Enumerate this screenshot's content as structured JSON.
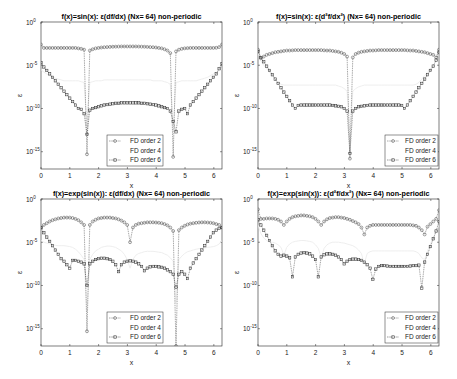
{
  "chart_data": [
    {
      "type": "line",
      "title": "f(x)=sin(x): ε(df/dx) (Nx= 64) non-periodic",
      "xlabel": "x",
      "ylabel": "ε",
      "yscale": "log",
      "xlim": [
        0,
        6.2832
      ],
      "ylim": [
        1e-17,
        1
      ],
      "xticks": [
        0,
        1,
        2,
        3,
        4,
        5,
        6
      ],
      "yticks": [
        "10^0",
        "10^-5",
        "10^-10",
        "10^-15"
      ],
      "legend": {
        "position": "lower center",
        "entries": [
          "FD order 2",
          "FD order 4",
          "FD order 6"
        ]
      },
      "series": [
        {
          "name": "FD order 2",
          "marker": "circle",
          "color": "#555555",
          "log10": [
            -2.6,
            -3.0,
            -3.0,
            -3.0,
            -3.0,
            -3.0,
            -3.0,
            -3.0,
            -3.0,
            -3.0,
            -3.0,
            -3.0,
            -3.0,
            -3.05,
            -3.1,
            -3.2,
            -15.3,
            -3.3,
            -3.15,
            -3.05,
            -3.0,
            -2.95,
            -2.92,
            -2.9,
            -2.88,
            -2.86,
            -2.85,
            -2.84,
            -2.83,
            -2.83,
            -2.83,
            -2.83,
            -2.83,
            -2.83,
            -2.84,
            -2.85,
            -2.86,
            -2.88,
            -2.9,
            -2.92,
            -2.95,
            -3.0,
            -3.05,
            -3.15,
            -3.3,
            -3.6,
            -15.6,
            -3.4,
            -3.2,
            -3.1,
            -3.05,
            -3.02,
            -3.0,
            -3.0,
            -3.0,
            -3.0,
            -3.0,
            -3.0,
            -3.0,
            -3.0,
            -3.0,
            -2.98,
            -2.9,
            -2.6
          ]
        },
        {
          "name": "FD order 4",
          "marker": "none",
          "color": "#f2f2f2",
          "log10": [
            -5.5,
            -5.8,
            -6.0,
            -6.2,
            -6.4,
            -6.5,
            -6.6,
            -6.7,
            -6.8,
            -6.8,
            -6.8,
            -6.8,
            -6.8,
            -6.8,
            -6.9,
            -7.0,
            -12.0,
            -7.0,
            -6.9,
            -6.8,
            -6.8,
            -6.8,
            -6.7,
            -6.7,
            -6.7,
            -6.7,
            -6.7,
            -6.7,
            -6.7,
            -6.7,
            -6.7,
            -6.7,
            -6.7,
            -6.7,
            -6.7,
            -6.7,
            -6.7,
            -6.7,
            -6.7,
            -6.8,
            -6.8,
            -6.8,
            -6.8,
            -6.9,
            -7.0,
            -7.2,
            -12.5,
            -7.0,
            -6.9,
            -6.8,
            -6.8,
            -6.8,
            -6.8,
            -6.8,
            -6.8,
            -6.7,
            -6.6,
            -6.5,
            -6.4,
            -6.2,
            -6.0,
            -5.8,
            -5.6,
            -5.4
          ]
        },
        {
          "name": "FD order 6",
          "marker": "square",
          "color": "#333333",
          "log10": [
            -4.7,
            -5.2,
            -5.6,
            -6.0,
            -6.4,
            -6.8,
            -7.2,
            -7.6,
            -8.0,
            -8.4,
            -8.8,
            -9.2,
            -9.6,
            -10.0,
            -10.1,
            -10.6,
            -13.0,
            -10.2,
            -10.0,
            -9.9,
            -9.8,
            -9.7,
            -9.6,
            -9.55,
            -9.5,
            -9.45,
            -9.4,
            -9.4,
            -9.35,
            -9.35,
            -9.35,
            -9.35,
            -9.35,
            -9.35,
            -9.35,
            -9.4,
            -9.4,
            -9.45,
            -9.5,
            -9.55,
            -9.6,
            -9.7,
            -9.8,
            -9.9,
            -10.0,
            -10.3,
            -11.5,
            -12.7,
            -10.3,
            -10.1,
            -10.0,
            -10.6,
            -9.6,
            -9.2,
            -8.8,
            -8.4,
            -8.0,
            -7.6,
            -7.2,
            -6.8,
            -6.4,
            -6.0,
            -5.4,
            -4.8
          ]
        }
      ]
    },
    {
      "type": "line",
      "title": "f(x)=sin(x): ε(d²f/dx²) (Nx= 64) non-periodic",
      "xlabel": "x",
      "ylabel": "ε",
      "yscale": "log",
      "xlim": [
        0,
        6.2832
      ],
      "ylim": [
        1e-17,
        1
      ],
      "xticks": [
        0,
        1,
        2,
        3,
        4,
        5,
        6
      ],
      "yticks": [
        "10^0",
        "10^-5",
        "10^-10",
        "10^-15"
      ],
      "legend": {
        "position": "lower right",
        "entries": [
          "FD order 2",
          "FD order 4",
          "FD order 6"
        ]
      },
      "series": [
        {
          "name": "FD order 2",
          "marker": "circle",
          "color": "#555555",
          "log10": [
            -3.2,
            -4.2,
            -4.0,
            -3.8,
            -3.7,
            -3.6,
            -3.5,
            -3.45,
            -3.4,
            -3.35,
            -3.3,
            -3.3,
            -3.28,
            -3.25,
            -3.25,
            -3.25,
            -3.25,
            -3.25,
            -3.25,
            -3.25,
            -3.25,
            -3.25,
            -3.25,
            -3.28,
            -3.3,
            -3.3,
            -3.35,
            -3.4,
            -3.45,
            -3.55,
            -3.7,
            -4.0,
            -15.8,
            -4.1,
            -3.7,
            -3.55,
            -3.45,
            -3.4,
            -3.35,
            -3.3,
            -3.3,
            -3.28,
            -3.25,
            -3.25,
            -3.25,
            -3.25,
            -3.25,
            -3.25,
            -3.25,
            -3.25,
            -3.25,
            -3.25,
            -3.28,
            -3.3,
            -3.3,
            -3.35,
            -3.4,
            -3.45,
            -3.5,
            -3.6,
            -3.7,
            -3.8,
            -4.1,
            -3.2
          ]
        },
        {
          "name": "FD order 4",
          "marker": "none",
          "color": "#f2f2f2",
          "log10": [
            -3.6,
            -4.5,
            -5.0,
            -5.4,
            -5.8,
            -6.2,
            -6.6,
            -7.0,
            -7.2,
            -7.3,
            -7.3,
            -7.3,
            -7.3,
            -7.3,
            -7.3,
            -7.3,
            -7.3,
            -7.3,
            -7.3,
            -7.3,
            -7.3,
            -7.3,
            -7.3,
            -7.3,
            -7.3,
            -7.3,
            -7.3,
            -7.3,
            -7.4,
            -7.5,
            -7.7,
            -8.0,
            -14.0,
            -8.0,
            -7.7,
            -7.5,
            -7.4,
            -7.3,
            -7.3,
            -7.3,
            -7.3,
            -7.3,
            -7.3,
            -7.3,
            -7.3,
            -7.3,
            -7.3,
            -7.3,
            -7.3,
            -7.3,
            -7.3,
            -7.3,
            -7.3,
            -7.3,
            -7.3,
            -7.2,
            -7.0,
            -6.6,
            -6.2,
            -5.8,
            -5.4,
            -5.0,
            -4.5,
            -3.6
          ]
        },
        {
          "name": "FD order 6",
          "marker": "square",
          "color": "#333333",
          "log10": [
            -3.4,
            -4.1,
            -4.6,
            -5.1,
            -5.6,
            -6.1,
            -6.6,
            -7.1,
            -7.6,
            -8.1,
            -8.6,
            -9.1,
            -9.6,
            -10.0,
            -9.65,
            -9.6,
            -9.6,
            -9.6,
            -9.6,
            -9.6,
            -9.6,
            -9.6,
            -9.6,
            -9.6,
            -9.6,
            -9.6,
            -9.65,
            -9.7,
            -9.75,
            -9.8,
            -10.0,
            -10.3,
            -15.2,
            -10.3,
            -10.0,
            -9.8,
            -9.75,
            -9.7,
            -9.65,
            -9.6,
            -9.6,
            -9.6,
            -9.6,
            -9.6,
            -9.6,
            -9.6,
            -9.6,
            -9.6,
            -9.6,
            -9.6,
            -9.65,
            -10.0,
            -9.6,
            -9.1,
            -8.6,
            -8.1,
            -7.6,
            -7.1,
            -6.6,
            -6.1,
            -5.6,
            -5.1,
            -4.4,
            -3.5
          ]
        }
      ]
    },
    {
      "type": "line",
      "title": "f(x)=exp(sin(x)): ε(df/dx) (Nx= 64) non-periodic",
      "xlabel": "x",
      "ylabel": "ε",
      "yscale": "log",
      "xlim": [
        0,
        6.2832
      ],
      "ylim": [
        1e-17,
        1
      ],
      "xticks": [
        0,
        1,
        2,
        3,
        4,
        5,
        6
      ],
      "yticks": [
        "10^0",
        "10^-5",
        "10^-10",
        "10^-15"
      ],
      "legend": {
        "position": "lower center",
        "entries": [
          "FD order 2",
          "FD order 4",
          "FD order 6"
        ]
      },
      "series": [
        {
          "name": "FD order 2",
          "marker": "circle",
          "color": "#555555",
          "log10": [
            -3.3,
            -3.0,
            -2.8,
            -2.6,
            -2.45,
            -2.35,
            -2.25,
            -2.2,
            -2.15,
            -2.15,
            -2.15,
            -2.2,
            -2.3,
            -2.45,
            -2.7,
            -3.0,
            -15.3,
            -3.0,
            -2.6,
            -2.4,
            -2.25,
            -2.2,
            -2.15,
            -2.15,
            -2.15,
            -2.2,
            -2.25,
            -2.35,
            -2.5,
            -2.7,
            -3.0,
            -5.0,
            -3.3,
            -3.0,
            -2.85,
            -2.8,
            -2.75,
            -2.7,
            -2.7,
            -2.7,
            -2.72,
            -2.75,
            -2.8,
            -2.9,
            -3.05,
            -3.3,
            -3.7,
            -17.0,
            -3.6,
            -3.3,
            -3.1,
            -2.95,
            -2.85,
            -2.8,
            -2.75,
            -2.72,
            -2.7,
            -2.7,
            -2.72,
            -2.75,
            -2.8,
            -2.9,
            -3.0,
            -3.3
          ]
        },
        {
          "name": "FD order 4",
          "marker": "none",
          "color": "#f2f2f2",
          "log10": [
            -4.8,
            -5.0,
            -5.1,
            -5.2,
            -5.3,
            -5.35,
            -5.4,
            -5.4,
            -5.4,
            -5.45,
            -5.5,
            -5.6,
            -5.8,
            -6.1,
            -6.5,
            -7.0,
            -13.0,
            -7.0,
            -6.4,
            -6.0,
            -5.8,
            -5.6,
            -5.5,
            -5.45,
            -5.45,
            -5.5,
            -5.6,
            -5.8,
            -6.0,
            -6.4,
            -7.0,
            -8.0,
            -7.0,
            -6.5,
            -6.3,
            -6.2,
            -6.1,
            -6.05,
            -6.05,
            -6.05,
            -6.1,
            -6.15,
            -6.2,
            -6.35,
            -6.5,
            -6.8,
            -7.2,
            -12.0,
            -7.0,
            -6.6,
            -6.3,
            -6.1,
            -6.0,
            -5.9,
            -5.8,
            -5.75,
            -5.7,
            -5.65,
            -5.6,
            -5.55,
            -5.5,
            -5.4,
            -5.2,
            -4.8
          ]
        },
        {
          "name": "FD order 6",
          "marker": "square",
          "color": "#333333",
          "log10": [
            -3.3,
            -3.9,
            -4.4,
            -4.9,
            -5.4,
            -5.9,
            -6.4,
            -6.9,
            -7.2,
            -7.6,
            -8.0,
            -7.1,
            -7.1,
            -7.2,
            -7.3,
            -7.5,
            -10.0,
            -7.5,
            -7.2,
            -7.0,
            -6.9,
            -6.85,
            -6.85,
            -6.9,
            -7.0,
            -7.2,
            -7.6,
            -8.4,
            -7.6,
            -7.3,
            -7.2,
            -7.15,
            -7.2,
            -7.3,
            -7.5,
            -7.8,
            -8.3,
            -8.0,
            -7.85,
            -7.8,
            -7.8,
            -7.85,
            -7.9,
            -8.0,
            -8.2,
            -8.4,
            -8.7,
            -10.2,
            -8.7,
            -8.4,
            -8.7,
            -9.2,
            -8.0,
            -7.4,
            -6.9,
            -6.4,
            -5.9,
            -5.4,
            -4.9,
            -4.4,
            -3.9,
            -3.6,
            -3.4,
            -3.3
          ]
        }
      ]
    },
    {
      "type": "line",
      "title": "f(x)=exp(sin(x)): ε(d²f/dx²) (Nx= 64) non-periodic",
      "xlabel": "x",
      "ylabel": "ε",
      "yscale": "log",
      "xlim": [
        0,
        6.2832
      ],
      "ylim": [
        1e-17,
        1
      ],
      "xticks": [
        0,
        1,
        2,
        3,
        4,
        5,
        6
      ],
      "yticks": [
        "10^0",
        "10^-5",
        "10^-10",
        "10^-15"
      ],
      "legend": {
        "position": "lower right",
        "entries": [
          "FD order 2",
          "FD order 4",
          "FD order 6"
        ]
      },
      "series": [
        {
          "name": "FD order 2",
          "marker": "circle",
          "color": "#555555",
          "log10": [
            -1.2,
            -2.3,
            -2.3,
            -2.25,
            -2.25,
            -2.25,
            -2.3,
            -2.4,
            -2.6,
            -3.0,
            -2.6,
            -2.3,
            -2.1,
            -2.0,
            -1.95,
            -1.9,
            -1.9,
            -1.95,
            -2.0,
            -2.1,
            -2.3,
            -2.6,
            -3.0,
            -2.6,
            -2.35,
            -2.2,
            -2.15,
            -2.1,
            -2.1,
            -2.15,
            -2.2,
            -2.3,
            -2.4,
            -2.55,
            -2.7,
            -2.9,
            -3.3,
            -4.1,
            -3.3,
            -3.1,
            -3.0,
            -3.0,
            -3.0,
            -3.0,
            -3.0,
            -3.0,
            -3.0,
            -3.0,
            -3.0,
            -3.0,
            -3.0,
            -3.0,
            -3.0,
            -3.0,
            -3.05,
            -3.1,
            -3.3,
            -3.6,
            -4.1,
            -3.2,
            -2.9,
            -2.6,
            -2.3,
            -1.3
          ]
        },
        {
          "name": "FD order 4",
          "marker": "none",
          "color": "#f2f2f2",
          "log10": [
            -3.0,
            -4.0,
            -4.5,
            -4.8,
            -5.0,
            -5.0,
            -5.1,
            -5.3,
            -5.6,
            -6.5,
            -5.6,
            -5.2,
            -5.0,
            -4.9,
            -4.85,
            -4.8,
            -4.8,
            -4.85,
            -4.9,
            -5.0,
            -5.3,
            -5.7,
            -6.8,
            -5.7,
            -5.3,
            -5.1,
            -5.0,
            -5.0,
            -5.0,
            -5.05,
            -5.1,
            -5.2,
            -5.3,
            -5.4,
            -5.6,
            -5.9,
            -6.3,
            -7.5,
            -6.3,
            -6.1,
            -6.0,
            -6.0,
            -6.0,
            -6.0,
            -6.0,
            -6.0,
            -6.0,
            -6.0,
            -6.0,
            -6.0,
            -6.0,
            -6.0,
            -6.0,
            -6.0,
            -6.0,
            -6.1,
            -6.3,
            -6.8,
            -7.0,
            -6.0,
            -5.2,
            -4.5,
            -3.8,
            -3.0
          ]
        },
        {
          "name": "FD order 4b",
          "marker": "none",
          "color": "#ffffff",
          "log10": []
        },
        {
          "name": "FD order 6",
          "marker": "square",
          "color": "#333333",
          "log10": [
            -2.4,
            -3.0,
            -3.6,
            -4.2,
            -4.8,
            -5.4,
            -6.0,
            -6.4,
            -6.6,
            -6.5,
            -6.6,
            -6.8,
            -9.0,
            -6.7,
            -6.4,
            -6.25,
            -6.2,
            -6.25,
            -6.35,
            -6.6,
            -7.0,
            -9.0,
            -6.7,
            -6.45,
            -6.35,
            -6.35,
            -6.4,
            -6.5,
            -6.7,
            -7.0,
            -7.5,
            -7.2,
            -7.0,
            -6.95,
            -6.95,
            -7.0,
            -7.1,
            -7.3,
            -7.6,
            -8.0,
            -9.3,
            -8.1,
            -7.8,
            -7.7,
            -7.7,
            -7.75,
            -7.8,
            -7.8,
            -7.8,
            -7.8,
            -7.8,
            -7.8,
            -7.8,
            -7.75,
            -7.7,
            -7.7,
            -7.65,
            -10.3,
            -7.3,
            -6.4,
            -5.5,
            -4.6,
            -3.7,
            -2.6
          ]
        }
      ]
    }
  ],
  "layout": {
    "panels": [
      {
        "left": 41,
        "top": 22,
        "width": 181,
        "height": 147
      },
      {
        "left": 258,
        "top": 22,
        "width": 181,
        "height": 147
      },
      {
        "left": 41,
        "top": 199,
        "width": 181,
        "height": 147
      },
      {
        "left": 258,
        "top": 199,
        "width": 181,
        "height": 147
      }
    ],
    "legend_boxes": [
      {
        "left": 107,
        "top": 135,
        "width": 56,
        "height": 31
      },
      {
        "left": 385,
        "top": 135,
        "width": 53,
        "height": 31
      },
      {
        "left": 107,
        "top": 312,
        "width": 56,
        "height": 31
      },
      {
        "left": 385,
        "top": 312,
        "width": 53,
        "height": 31
      }
    ]
  }
}
